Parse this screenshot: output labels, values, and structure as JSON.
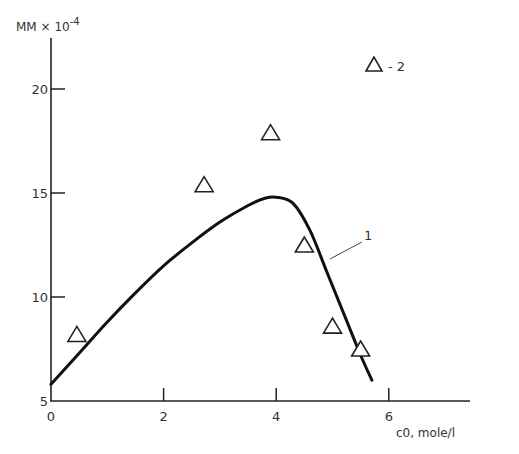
{
  "chart_data": {
    "type": "line",
    "title": "",
    "xlabel": "c0, mole/l",
    "ylabel": "MM × 10^-4",
    "ylabel_main": "MM × 10",
    "ylabel_exp": "-4",
    "xlim": [
      0,
      7.5
    ],
    "ylim": [
      5,
      23
    ],
    "x_ticks": [
      0,
      2,
      4,
      6
    ],
    "x_tick_labels": [
      "0",
      "2",
      "4",
      "6"
    ],
    "y_ticks": [
      5,
      10,
      15,
      20
    ],
    "y_tick_labels": [
      "5",
      "10",
      "15",
      "20"
    ],
    "grid": false,
    "series": [
      {
        "name": "1",
        "kind": "line",
        "x": [
          0.0,
          0.5,
          1.0,
          1.5,
          2.0,
          2.5,
          3.0,
          3.5,
          3.8,
          4.0,
          4.3,
          4.6,
          4.9,
          5.2,
          5.5,
          5.7
        ],
        "values": [
          5.8,
          7.3,
          8.8,
          10.2,
          11.5,
          12.6,
          13.6,
          14.4,
          14.75,
          14.8,
          14.5,
          13.2,
          11.2,
          9.2,
          7.2,
          6.0
        ]
      },
      {
        "name": "2",
        "kind": "scatter",
        "marker": "triangle-open",
        "x": [
          0.46,
          2.72,
          3.9,
          4.5,
          5.0,
          5.5
        ],
        "values": [
          8.2,
          15.4,
          17.9,
          12.5,
          8.6,
          7.5
        ]
      }
    ],
    "annotations": [
      {
        "text": "1",
        "target_series": "1",
        "x": 4.85,
        "y": 12.2
      }
    ],
    "legend": {
      "position": "top-right",
      "entries": [
        {
          "symbol": "triangle-open",
          "text": "- 2"
        }
      ]
    }
  },
  "labels": {
    "curve_label": "1",
    "legend_text": "- 2"
  }
}
